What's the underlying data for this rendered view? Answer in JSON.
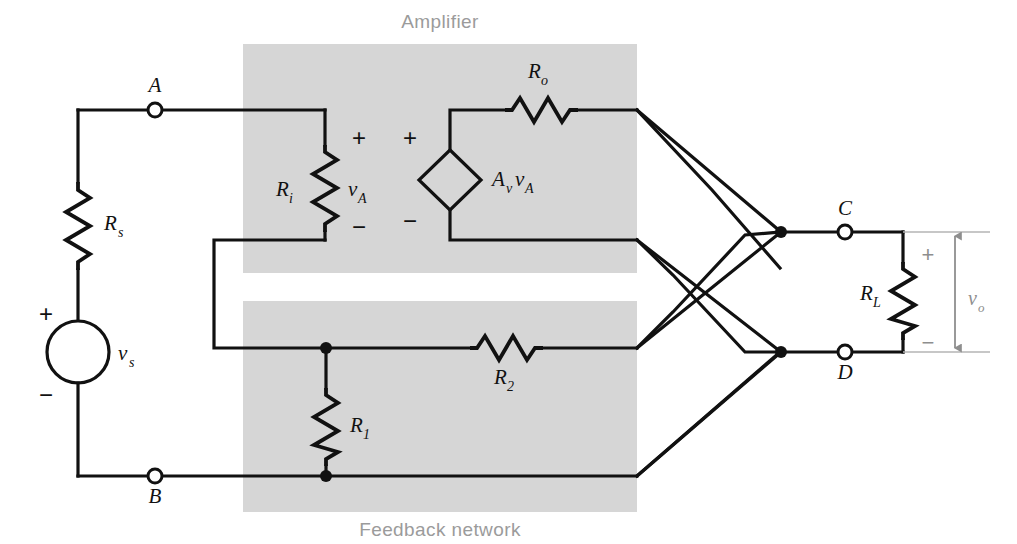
{
  "figure": {
    "type": "circuit-schematic"
  },
  "blocks": {
    "amplifier": {
      "label": "Amplifier",
      "shade_color": "#d6d6d6"
    },
    "feedback": {
      "label": "Feedback network",
      "shade_color": "#d6d6d6"
    }
  },
  "components": {
    "rs": {
      "base": "R",
      "sub": "s",
      "kind": "resistor",
      "orientation": "vertical"
    },
    "ri": {
      "base": "R",
      "sub": "i",
      "kind": "resistor",
      "orientation": "vertical"
    },
    "ro": {
      "base": "R",
      "sub": "o",
      "kind": "resistor",
      "orientation": "horizontal"
    },
    "r1": {
      "base": "R",
      "sub": "1",
      "kind": "resistor",
      "orientation": "vertical"
    },
    "r2": {
      "base": "R",
      "sub": "2",
      "kind": "resistor",
      "orientation": "horizontal"
    },
    "rl": {
      "base": "R",
      "sub": "L",
      "kind": "resistor",
      "orientation": "vertical"
    },
    "vs": {
      "base": "v",
      "sub": "s",
      "kind": "independent-voltage-source",
      "shape": "circle"
    },
    "va": {
      "base": "v",
      "sub": "A",
      "kind": "voltage-label"
    },
    "vo": {
      "base": "v",
      "sub": "o",
      "kind": "output-voltage-label"
    },
    "dependent_source": {
      "base": "A",
      "sub": "v",
      "base2": "v",
      "sub2": "A",
      "kind": "vcvs",
      "shape": "diamond"
    }
  },
  "terminals": [
    {
      "id": "A",
      "label": "A",
      "style": "open"
    },
    {
      "id": "B",
      "label": "B",
      "style": "open"
    },
    {
      "id": "C",
      "label": "C",
      "style": "open"
    },
    {
      "id": "D",
      "label": "D",
      "style": "open"
    }
  ],
  "polarity_marks": {
    "vs_plus": "+",
    "vs_minus": "−",
    "ri_plus": "+",
    "ri_minus": "−",
    "dep_plus": "+",
    "dep_minus": "−",
    "vo_plus": "+",
    "vo_minus": "−"
  },
  "colors": {
    "wire": "#111111",
    "shade": "#d6d6d6",
    "block_text": "#9b9b9b",
    "annotation_gray": "#8e8e8e",
    "background": "#ffffff"
  }
}
